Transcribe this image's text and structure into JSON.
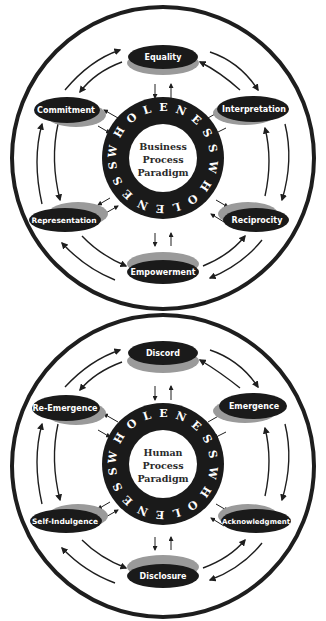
{
  "colors": {
    "ink": "#1e1e1e",
    "node_fill": "#1a1a1a",
    "node_rim": "#9a9a9a",
    "background": "#ffffff"
  },
  "diagrams": [
    {
      "id": "business",
      "center_lines": [
        "Business",
        "Process",
        "Paradigm"
      ],
      "ring_text": "WHOLENESSWHOLENESS",
      "nodes": [
        {
          "label": "Equality",
          "position": "top"
        },
        {
          "label": "Interpretation",
          "position": "upper-right"
        },
        {
          "label": "Reciprocity",
          "position": "lower-right"
        },
        {
          "label": "Empowerment",
          "position": "bottom"
        },
        {
          "label": "Representation",
          "position": "lower-left"
        },
        {
          "label": "Commitment",
          "position": "upper-left"
        }
      ]
    },
    {
      "id": "human",
      "center_lines": [
        "Human",
        "Process",
        "Paradigm"
      ],
      "ring_text": "WHOLENESSWHOLENESS",
      "nodes": [
        {
          "label": "Discord",
          "position": "top"
        },
        {
          "label": "Emergence",
          "position": "upper-right"
        },
        {
          "label": "Acknowledgment",
          "position": "lower-right"
        },
        {
          "label": "Disclosure",
          "position": "bottom"
        },
        {
          "label": "Self-Indulgence",
          "position": "lower-left"
        },
        {
          "label": "Re-Emergence",
          "position": "upper-left"
        }
      ]
    }
  ]
}
